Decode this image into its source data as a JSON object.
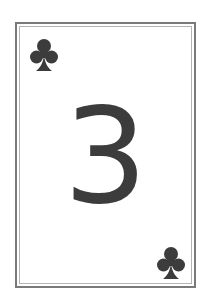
{
  "card": {
    "rank": "3",
    "suit": "clubs",
    "suit_icon": "club-icon",
    "ink_color": "#3c3c3c",
    "border_color": "#7a7a7a"
  }
}
